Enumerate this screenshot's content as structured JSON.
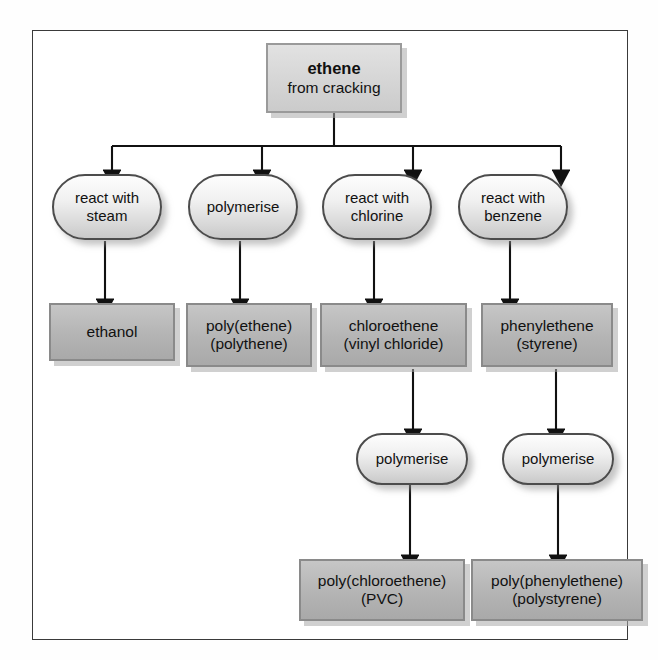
{
  "diagram": {
    "colors": {
      "frame_border": "#3a3a3a",
      "box_fill": "#b4b4b4",
      "box_border": "#8a8a8a",
      "pill_fill": "#e8e8e8",
      "pill_border": "#4c4c4c",
      "arrow": "#111111",
      "text": "#111111"
    },
    "root": {
      "id": "ethene",
      "line1": "ethene",
      "line2": "from cracking"
    },
    "steps": [
      {
        "id": "step-steam",
        "line1": "react with",
        "line2": "steam"
      },
      {
        "id": "step-polymerise-1",
        "line1": "polymerise",
        "line2": ""
      },
      {
        "id": "step-chlorine",
        "line1": "react with",
        "line2": "chlorine"
      },
      {
        "id": "step-benzene",
        "line1": "react with",
        "line2": "benzene"
      }
    ],
    "products": [
      {
        "id": "product-ethanol",
        "line1": "ethanol",
        "line2": ""
      },
      {
        "id": "product-polyethene",
        "line1": "poly(ethene)",
        "line2": "(polythene)"
      },
      {
        "id": "product-chloroethene",
        "line1": "chloroethene",
        "line2": "(vinyl chloride)"
      },
      {
        "id": "product-phenylethene",
        "line1": "phenylethene",
        "line2": "(styrene)"
      }
    ],
    "steps2": [
      {
        "id": "step-polymerise-2",
        "line1": "polymerise",
        "line2": ""
      },
      {
        "id": "step-polymerise-3",
        "line1": "polymerise",
        "line2": ""
      }
    ],
    "polymers": [
      {
        "id": "polymer-pvc",
        "line1": "poly(chloroethene)",
        "line2": "(PVC)"
      },
      {
        "id": "polymer-polystyrene",
        "line1": "poly(phenylethene)",
        "line2": "(polystyrene)"
      }
    ]
  }
}
